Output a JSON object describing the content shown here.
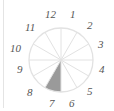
{
  "diagram": {
    "type": "clock-sector-diagram",
    "center": [
      61,
      60
    ],
    "radius": 32,
    "sector_count": 12,
    "highlighted_sector": 7,
    "colors": {
      "lines": "#e2e2e2",
      "highlight": "#9a9a9a",
      "labels": "#555555"
    },
    "labels": [
      "12",
      "1",
      "2",
      "3",
      "4",
      "5",
      "6",
      "7",
      "8",
      "9",
      "10",
      "11"
    ]
  }
}
